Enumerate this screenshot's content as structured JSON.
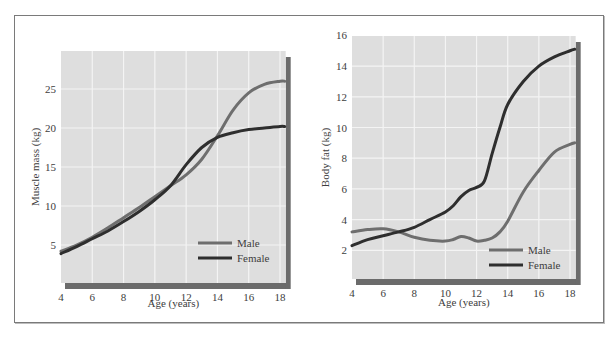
{
  "colors": {
    "plot_bg": "#dedede",
    "grid": "#f4f4f4",
    "shadow": "#6b6b6b",
    "male": "#6e6e6e",
    "female": "#2e2e2e",
    "text": "#3d3d3d"
  },
  "chart_data": [
    {
      "type": "line",
      "title": "",
      "xlabel": "Age (years)",
      "ylabel": "Muscle mass (kg)",
      "xlim": [
        4,
        18.3
      ],
      "ylim": [
        0,
        30
      ],
      "x_ticks": [
        4,
        6,
        8,
        10,
        12,
        14,
        16,
        18
      ],
      "y_ticks": [
        5,
        10,
        15,
        20,
        25
      ],
      "grid": true,
      "legend_position": "lower right",
      "x": [
        4,
        5,
        6,
        7,
        8,
        9,
        10,
        11,
        12,
        13,
        14,
        15,
        16,
        17,
        18,
        18.3
      ],
      "series": [
        {
          "name": "Male",
          "values": [
            4.2,
            5.0,
            6.0,
            7.2,
            8.5,
            9.8,
            11.2,
            12.6,
            14.0,
            16.0,
            19.0,
            22.3,
            24.5,
            25.6,
            26.0,
            26.0
          ]
        },
        {
          "name": "Female",
          "values": [
            3.9,
            4.8,
            5.8,
            6.8,
            8.0,
            9.3,
            10.8,
            12.6,
            15.3,
            17.5,
            18.8,
            19.4,
            19.8,
            20.0,
            20.2,
            20.2
          ]
        }
      ]
    },
    {
      "type": "line",
      "title": "",
      "xlabel": "Age (years)",
      "ylabel": "Body fat (kg)",
      "xlim": [
        4,
        18.3
      ],
      "ylim": [
        0,
        16
      ],
      "x_ticks": [
        4,
        6,
        8,
        10,
        12,
        14,
        16,
        18
      ],
      "y_ticks": [
        2,
        4,
        6,
        8,
        10,
        12,
        14,
        16
      ],
      "grid": true,
      "legend_position": "lower right",
      "x": [
        4,
        5,
        6,
        7,
        8,
        9,
        10,
        10.5,
        11,
        11.5,
        12,
        12.5,
        13,
        13.5,
        14,
        15,
        16,
        17,
        18,
        18.3
      ],
      "series": [
        {
          "name": "Male",
          "values": [
            3.2,
            3.35,
            3.4,
            3.2,
            2.85,
            2.65,
            2.6,
            2.7,
            2.9,
            2.8,
            2.6,
            2.65,
            2.8,
            3.2,
            3.9,
            5.8,
            7.2,
            8.4,
            8.9,
            9.0
          ]
        },
        {
          "name": "Female",
          "values": [
            2.3,
            2.7,
            2.95,
            3.2,
            3.5,
            4.0,
            4.5,
            4.9,
            5.5,
            5.9,
            6.1,
            6.5,
            8.3,
            10.0,
            11.5,
            13.0,
            14.0,
            14.6,
            15.0,
            15.1
          ]
        }
      ]
    }
  ]
}
